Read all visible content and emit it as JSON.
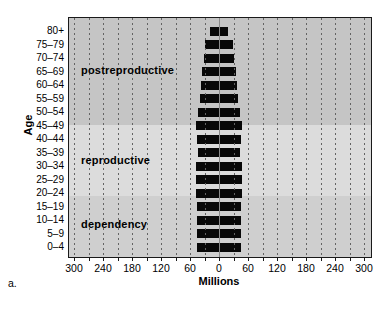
{
  "figure_label": "a.",
  "chart_data": {
    "type": "bar",
    "variant": "population-pyramid",
    "title": "",
    "xlabel": "Millions",
    "ylabel": "Age",
    "categories": [
      "80+",
      "75–79",
      "70–74",
      "65–69",
      "60–64",
      "55–59",
      "50–54",
      "45–49",
      "40–44",
      "35–39",
      "30–34",
      "25–29",
      "20–24",
      "15–19",
      "10–14",
      "5–9",
      "0–4"
    ],
    "values_millions_total": [
      38,
      58,
      62,
      70,
      74,
      79,
      86,
      95,
      93,
      86,
      94,
      97,
      94,
      90,
      93,
      90,
      92
    ],
    "x_tick_labels": [
      "300",
      "240",
      "180",
      "120",
      "60",
      "0",
      "60",
      "120",
      "180",
      "240",
      "300"
    ],
    "x_tick_values_millions": [
      -300,
      -240,
      -180,
      -120,
      -60,
      0,
      60,
      120,
      180,
      240,
      300
    ],
    "xlim_millions": [
      -313,
      313
    ],
    "minor_grid_interval_millions": 30,
    "grid": "dashed-vertical",
    "bar_color": "#080808",
    "regions": [
      {
        "label": "postreproductive",
        "band_color": "#c5c5c5"
      },
      {
        "label": "reproductive",
        "band_color": "#dcdcdc"
      },
      {
        "label": "dependency",
        "band_color": "#cfcfcf"
      }
    ]
  }
}
